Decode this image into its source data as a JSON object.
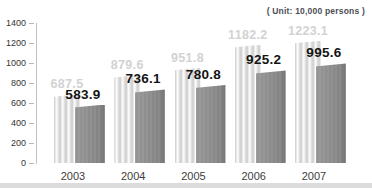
{
  "unit_label": "( Unit: 10,000 persons )",
  "colors": {
    "background": "#ffffff",
    "light_bar": "#dedede",
    "light_bar_highlight": "#ffffff",
    "dark_bar": "#8e8e8e",
    "dark_bar_edge": "#6f6f6f",
    "light_value_label": "#d2d2d2",
    "dark_value_label": "#141414",
    "axis_line": "#c2c2c2",
    "tick_label": "#333333",
    "year_label": "#3d3d3d",
    "bottom_strip": "#dcdcdc"
  },
  "chart_data": {
    "type": "bar",
    "categories": [
      "2003",
      "2004",
      "2005",
      "2006",
      "2007"
    ],
    "series": [
      {
        "name": "back-light-gray-bars",
        "values": [
          687.5,
          879.6,
          951.8,
          1182.2,
          1223.1
        ]
      },
      {
        "name": "front-dark-gray-bars",
        "values": [
          583.9,
          736.1,
          780.8,
          925.2,
          995.6
        ]
      }
    ],
    "title": "",
    "xlabel": "",
    "ylabel": "",
    "unit": "10,000 persons",
    "ylim": [
      0,
      1400
    ],
    "y_ticks": [
      0,
      200,
      400,
      600,
      800,
      1000,
      1200,
      1400
    ],
    "grid": false,
    "legend": "none",
    "value_labels": true
  }
}
